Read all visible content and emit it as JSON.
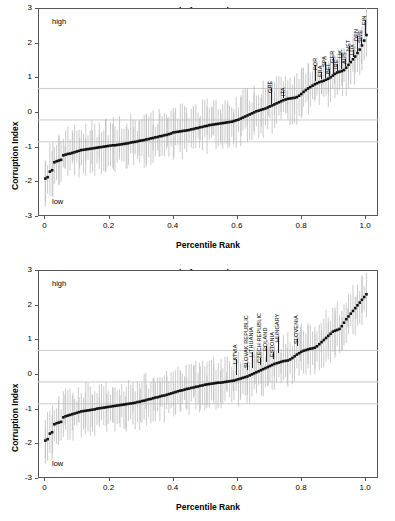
{
  "figure": {
    "background": "#ffffff",
    "ink": "#000000",
    "grid_color": "#c9c9c9",
    "errorbar_color": "#bdbdbd"
  },
  "panels": [
    {
      "id": "eu15",
      "title_line1": "Control of Corruption",
      "title_line2": "EU-15",
      "high_label": "high",
      "low_label": "low",
      "xlabel": "Percentile Rank",
      "ylabel": "Corruption Index"
    },
    {
      "id": "eu8",
      "title_line1": "Control of Corruption",
      "title_line2": "EU-8",
      "high_label": "high",
      "low_label": "low",
      "xlabel": "Percentile Rank",
      "ylabel": "Corruption Index"
    }
  ],
  "chart_data": [
    {
      "type": "scatter",
      "id": "eu15",
      "title": "Control of Corruption EU-15",
      "subtitle": "EU-15",
      "xlabel": "Percentile Rank",
      "ylabel": "Corruption Index",
      "xlim": [
        -0.02,
        1.04
      ],
      "ylim": [
        -3,
        3
      ],
      "xticks": [
        0,
        0.2,
        0.4,
        0.6,
        0.8,
        1.0
      ],
      "xticklabels": [
        "0",
        "0.2",
        "0.4",
        "0.6",
        "0.8",
        "1.0"
      ],
      "yticks": [
        -3,
        -2,
        -1,
        0,
        1,
        2,
        3
      ],
      "yticklabels": [
        "-3",
        "-2",
        "-1",
        "0",
        "1",
        "2",
        "3"
      ],
      "grid": true,
      "gridlines_y": [
        0.68,
        -0.23,
        -0.86
      ],
      "legend": "none",
      "annotations_axes": [
        {
          "text": "high",
          "x": 0.04,
          "y": 2.55
        },
        {
          "text": "low",
          "x": 0.04,
          "y": -2.55
        }
      ],
      "series": [
        {
          "name": "Point estimate (ranked countries)",
          "marker": "square",
          "color": "#111111",
          "x": [
            0.003,
            0.01,
            0.017,
            0.024,
            0.031,
            0.038,
            0.045,
            0.052,
            0.059,
            0.066,
            0.073,
            0.08,
            0.087,
            0.094,
            0.101,
            0.108,
            0.115,
            0.122,
            0.129,
            0.136,
            0.143,
            0.15,
            0.157,
            0.164,
            0.171,
            0.178,
            0.185,
            0.192,
            0.199,
            0.206,
            0.213,
            0.22,
            0.227,
            0.234,
            0.241,
            0.248,
            0.255,
            0.262,
            0.269,
            0.276,
            0.283,
            0.29,
            0.297,
            0.304,
            0.311,
            0.318,
            0.325,
            0.332,
            0.339,
            0.346,
            0.353,
            0.36,
            0.367,
            0.374,
            0.381,
            0.388,
            0.395,
            0.402,
            0.409,
            0.416,
            0.423,
            0.43,
            0.437,
            0.444,
            0.451,
            0.458,
            0.465,
            0.472,
            0.479,
            0.486,
            0.493,
            0.5,
            0.507,
            0.514,
            0.521,
            0.528,
            0.535,
            0.542,
            0.549,
            0.556,
            0.563,
            0.57,
            0.577,
            0.584,
            0.591,
            0.598,
            0.605,
            0.612,
            0.619,
            0.626,
            0.633,
            0.64,
            0.647,
            0.654,
            0.661,
            0.668,
            0.675,
            0.682,
            0.689,
            0.696,
            0.703,
            0.71,
            0.717,
            0.724,
            0.731,
            0.738,
            0.745,
            0.752,
            0.759,
            0.766,
            0.773,
            0.78,
            0.787,
            0.794,
            0.801,
            0.808,
            0.815,
            0.822,
            0.829,
            0.836,
            0.843,
            0.85,
            0.857,
            0.864,
            0.871,
            0.878,
            0.885,
            0.892,
            0.899,
            0.906,
            0.913,
            0.92,
            0.927,
            0.934,
            0.941,
            0.948,
            0.955,
            0.962,
            0.969,
            0.976,
            0.983,
            0.99,
            0.997,
            1.004
          ],
          "y": [
            -1.92,
            -1.88,
            -1.72,
            -1.68,
            -1.45,
            -1.42,
            -1.4,
            -1.38,
            -1.25,
            -1.23,
            -1.21,
            -1.2,
            -1.18,
            -1.16,
            -1.14,
            -1.12,
            -1.1,
            -1.09,
            -1.08,
            -1.07,
            -1.06,
            -1.05,
            -1.04,
            -1.03,
            -1.02,
            -1.01,
            -1.0,
            -0.99,
            -0.98,
            -0.97,
            -0.96,
            -0.96,
            -0.95,
            -0.94,
            -0.93,
            -0.92,
            -0.91,
            -0.9,
            -0.88,
            -0.87,
            -0.86,
            -0.85,
            -0.83,
            -0.82,
            -0.81,
            -0.79,
            -0.78,
            -0.76,
            -0.75,
            -0.73,
            -0.72,
            -0.7,
            -0.69,
            -0.67,
            -0.66,
            -0.64,
            -0.62,
            -0.59,
            -0.58,
            -0.57,
            -0.56,
            -0.55,
            -0.54,
            -0.53,
            -0.52,
            -0.5,
            -0.49,
            -0.47,
            -0.46,
            -0.44,
            -0.43,
            -0.41,
            -0.4,
            -0.38,
            -0.37,
            -0.36,
            -0.35,
            -0.34,
            -0.33,
            -0.32,
            -0.31,
            -0.3,
            -0.29,
            -0.28,
            -0.26,
            -0.24,
            -0.22,
            -0.19,
            -0.16,
            -0.13,
            -0.1,
            -0.07,
            -0.04,
            -0.01,
            0.02,
            0.04,
            0.06,
            0.08,
            0.1,
            0.13,
            0.16,
            0.19,
            0.22,
            0.25,
            0.28,
            0.31,
            0.34,
            0.36,
            0.38,
            0.39,
            0.4,
            0.41,
            0.43,
            0.47,
            0.52,
            0.58,
            0.63,
            0.68,
            0.72,
            0.76,
            0.8,
            0.83,
            0.86,
            0.88,
            0.9,
            0.93,
            0.96,
            1.0,
            1.05,
            1.1,
            1.14,
            1.16,
            1.18,
            1.21,
            1.28,
            1.36,
            1.44,
            1.52,
            1.6,
            1.7,
            1.8,
            1.92,
            2.06,
            2.22
          ],
          "error_low_offset": -0.55,
          "error_high_offset": 0.55
        }
      ],
      "point_annotations": [
        {
          "label": "GRE",
          "x": 0.705,
          "y": 0.22
        },
        {
          "label": "ITA",
          "x": 0.745,
          "y": 0.4
        },
        {
          "label": "POR",
          "x": 0.845,
          "y": 0.9
        },
        {
          "label": "FRA",
          "x": 0.862,
          "y": 0.94
        },
        {
          "label": "SPA",
          "x": 0.874,
          "y": 0.99
        },
        {
          "label": "BEL",
          "x": 0.888,
          "y": 1.04
        },
        {
          "label": "GER",
          "x": 0.9,
          "y": 1.1
        },
        {
          "label": "IRE",
          "x": 0.912,
          "y": 1.17
        },
        {
          "label": "UK",
          "x": 0.924,
          "y": 1.24
        },
        {
          "label": "AUS",
          "x": 0.936,
          "y": 1.33
        },
        {
          "label": "NET",
          "x": 0.95,
          "y": 1.45
        },
        {
          "label": "LUX",
          "x": 0.962,
          "y": 1.58
        },
        {
          "label": "DEN",
          "x": 0.974,
          "y": 1.74
        },
        {
          "label": "SWE",
          "x": 0.986,
          "y": 1.93
        },
        {
          "label": "FIN",
          "x": 1.0,
          "y": 2.18
        }
      ]
    },
    {
      "type": "scatter",
      "id": "eu8",
      "title": "Control of Corruption EU-8",
      "subtitle": "EU-8",
      "xlabel": "Percentile Rank",
      "ylabel": "Corruption Index",
      "xlim": [
        -0.02,
        1.04
      ],
      "ylim": [
        -3,
        3
      ],
      "xticks": [
        0,
        0.2,
        0.4,
        0.6,
        0.8,
        1.0
      ],
      "xticklabels": [
        "0",
        "0.2",
        "0.4",
        "0.6",
        "0.8",
        "1.0"
      ],
      "yticks": [
        -3,
        -2,
        -1,
        0,
        1,
        2,
        3
      ],
      "yticklabels": [
        "-3",
        "-2",
        "-1",
        "0",
        "1",
        "2",
        "3"
      ],
      "grid": true,
      "gridlines_y": [
        0.68,
        -0.23,
        -0.86
      ],
      "legend": "none",
      "annotations_axes": [
        {
          "text": "high",
          "x": 0.04,
          "y": 2.55
        },
        {
          "text": "low",
          "x": 0.04,
          "y": -2.55
        }
      ],
      "series": [
        {
          "name": "Point estimate (ranked countries)",
          "marker": "square",
          "color": "#111111",
          "x": [
            0.003,
            0.01,
            0.017,
            0.024,
            0.031,
            0.038,
            0.045,
            0.052,
            0.059,
            0.066,
            0.073,
            0.08,
            0.087,
            0.094,
            0.101,
            0.108,
            0.115,
            0.122,
            0.129,
            0.136,
            0.143,
            0.15,
            0.157,
            0.164,
            0.171,
            0.178,
            0.185,
            0.192,
            0.199,
            0.206,
            0.213,
            0.22,
            0.227,
            0.234,
            0.241,
            0.248,
            0.255,
            0.262,
            0.269,
            0.276,
            0.283,
            0.29,
            0.297,
            0.304,
            0.311,
            0.318,
            0.325,
            0.332,
            0.339,
            0.346,
            0.353,
            0.36,
            0.367,
            0.374,
            0.381,
            0.388,
            0.395,
            0.402,
            0.409,
            0.416,
            0.423,
            0.43,
            0.437,
            0.444,
            0.451,
            0.458,
            0.465,
            0.472,
            0.479,
            0.486,
            0.493,
            0.5,
            0.507,
            0.514,
            0.521,
            0.528,
            0.535,
            0.542,
            0.549,
            0.556,
            0.563,
            0.57,
            0.577,
            0.584,
            0.591,
            0.598,
            0.605,
            0.612,
            0.619,
            0.626,
            0.633,
            0.64,
            0.647,
            0.654,
            0.661,
            0.668,
            0.675,
            0.682,
            0.689,
            0.696,
            0.703,
            0.71,
            0.717,
            0.724,
            0.731,
            0.738,
            0.745,
            0.752,
            0.759,
            0.766,
            0.773,
            0.78,
            0.787,
            0.794,
            0.801,
            0.808,
            0.815,
            0.822,
            0.829,
            0.836,
            0.843,
            0.85,
            0.857,
            0.864,
            0.871,
            0.878,
            0.885,
            0.892,
            0.899,
            0.906,
            0.913,
            0.92,
            0.927,
            0.934,
            0.941,
            0.948,
            0.955,
            0.962,
            0.969,
            0.976,
            0.983,
            0.99,
            0.997,
            1.004
          ],
          "y": [
            -1.92,
            -1.88,
            -1.72,
            -1.68,
            -1.45,
            -1.42,
            -1.4,
            -1.38,
            -1.25,
            -1.22,
            -1.2,
            -1.18,
            -1.16,
            -1.14,
            -1.12,
            -1.1,
            -1.08,
            -1.07,
            -1.06,
            -1.05,
            -1.04,
            -1.03,
            -1.02,
            -1.0,
            -0.99,
            -0.98,
            -0.97,
            -0.96,
            -0.95,
            -0.94,
            -0.93,
            -0.92,
            -0.91,
            -0.9,
            -0.89,
            -0.88,
            -0.87,
            -0.86,
            -0.85,
            -0.84,
            -0.83,
            -0.81,
            -0.8,
            -0.78,
            -0.77,
            -0.75,
            -0.73,
            -0.72,
            -0.7,
            -0.68,
            -0.67,
            -0.65,
            -0.63,
            -0.62,
            -0.6,
            -0.58,
            -0.56,
            -0.54,
            -0.52,
            -0.5,
            -0.48,
            -0.47,
            -0.45,
            -0.43,
            -0.42,
            -0.4,
            -0.39,
            -0.37,
            -0.36,
            -0.34,
            -0.33,
            -0.31,
            -0.3,
            -0.29,
            -0.28,
            -0.27,
            -0.26,
            -0.25,
            -0.25,
            -0.24,
            -0.23,
            -0.22,
            -0.21,
            -0.2,
            -0.19,
            -0.17,
            -0.15,
            -0.13,
            -0.11,
            -0.09,
            -0.07,
            -0.04,
            -0.01,
            0.02,
            0.05,
            0.08,
            0.11,
            0.14,
            0.17,
            0.2,
            0.23,
            0.26,
            0.29,
            0.31,
            0.33,
            0.35,
            0.37,
            0.38,
            0.39,
            0.42,
            0.46,
            0.51,
            0.56,
            0.6,
            0.64,
            0.67,
            0.69,
            0.71,
            0.73,
            0.74,
            0.76,
            0.8,
            0.86,
            0.92,
            0.98,
            1.04,
            1.1,
            1.16,
            1.22,
            1.25,
            1.27,
            1.3,
            1.38,
            1.48,
            1.58,
            1.66,
            1.74,
            1.82,
            1.9,
            1.98,
            2.06,
            2.14,
            2.22,
            2.3
          ],
          "error_low_offset": -0.55,
          "error_high_offset": 0.55
        }
      ],
      "point_annotations": [
        {
          "label": "LATVIA",
          "x": 0.598,
          "y": -0.02
        },
        {
          "label": "SLOVAK REPUBLIC",
          "x": 0.632,
          "y": 0.11
        },
        {
          "label": "LITHUANIA",
          "x": 0.648,
          "y": 0.17
        },
        {
          "label": "CZECH REPUBLIC",
          "x": 0.672,
          "y": 0.27
        },
        {
          "label": "POLAND",
          "x": 0.69,
          "y": 0.34
        },
        {
          "label": "ESTONIA",
          "x": 0.712,
          "y": 0.44
        },
        {
          "label": "HUNGARY",
          "x": 0.728,
          "y": 0.6
        },
        {
          "label": "SLOVENIA",
          "x": 0.788,
          "y": 0.8
        }
      ]
    }
  ]
}
